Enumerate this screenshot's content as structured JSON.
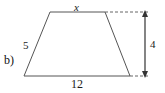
{
  "figure": {
    "part_label": "b)",
    "shape": "trapezoid",
    "labels": {
      "top_side": "x",
      "left_side": "5",
      "height": "4",
      "bottom_side": "12"
    },
    "colors": {
      "stroke": "#555555",
      "dashed_stroke": "#666666",
      "arrow": "#333333",
      "text": "#111111",
      "background": "#ffffff"
    },
    "geometry": {
      "top_left": [
        50,
        12
      ],
      "top_right": [
        105,
        12
      ],
      "bottom_right": [
        130,
        76
      ],
      "bottom_left": [
        24,
        76
      ],
      "dash_top": [
        105,
        12,
        148,
        12
      ],
      "dash_bottom": [
        130,
        76,
        148,
        76
      ],
      "arrow_line": [
        145,
        12,
        145,
        76
      ]
    }
  }
}
